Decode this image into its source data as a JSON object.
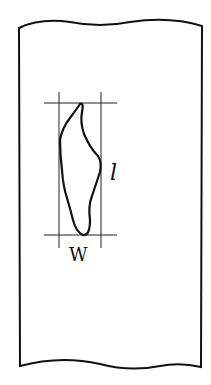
{
  "diagram": {
    "labels": {
      "length": "l",
      "width": "W"
    },
    "colors": {
      "stroke": "#111111",
      "background": "#ffffff"
    }
  }
}
